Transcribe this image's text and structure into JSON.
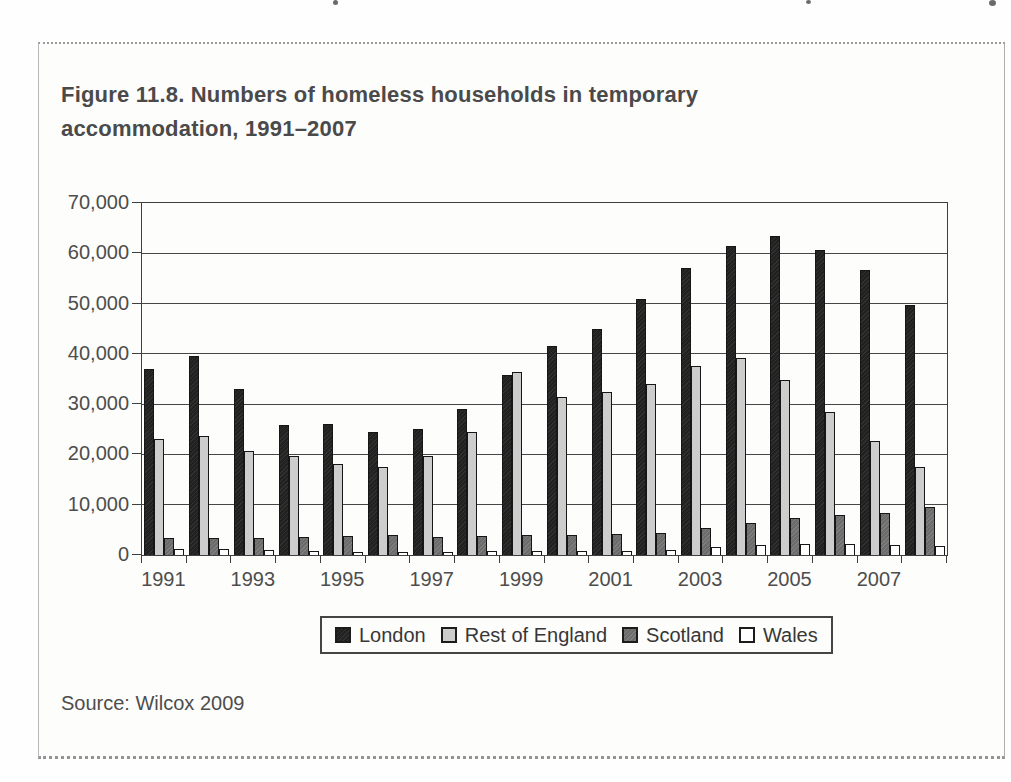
{
  "page": {
    "title_line1": "Figure 11.8. Numbers of homeless households in temporary",
    "title_line2": "accommodation, 1991–2007",
    "source": "Source: Wilcox 2009"
  },
  "chart_data": {
    "type": "bar",
    "title": "Figure 11.8. Numbers of homeless households in temporary accommodation, 1991–2007",
    "categories": [
      "1991",
      "1992",
      "1993",
      "1994",
      "1995",
      "1996",
      "1997",
      "1998",
      "1999",
      "2000",
      "2001",
      "2002",
      "2003",
      "2004",
      "2005",
      "2006",
      "2007",
      "2008"
    ],
    "x_axis_labels_shown": [
      "1991",
      "1993",
      "1995",
      "1997",
      "1999",
      "2001",
      "2003",
      "2005",
      "2007"
    ],
    "series": [
      {
        "name": "London",
        "color": "#212121",
        "values": [
          37000,
          39500,
          33000,
          25800,
          26100,
          24500,
          25000,
          29000,
          35700,
          41500,
          45000,
          51000,
          57000,
          61500,
          63500,
          60700,
          56700,
          49700
        ]
      },
      {
        "name": "Rest of England",
        "color": "#cdcdcd",
        "values": [
          23000,
          23700,
          20700,
          19700,
          18000,
          17500,
          19600,
          24500,
          36300,
          31500,
          32500,
          34000,
          37500,
          39200,
          34900,
          28500,
          22700,
          17500
        ]
      },
      {
        "name": "Scotland",
        "color": "#6c6c6c",
        "values": [
          3400,
          3400,
          3400,
          3500,
          3800,
          4000,
          3600,
          3700,
          4000,
          3900,
          4100,
          4300,
          5300,
          6400,
          7400,
          8000,
          8400,
          9500
        ]
      },
      {
        "name": "Wales",
        "color": "#ffffff",
        "values": [
          1200,
          1100,
          900,
          800,
          600,
          500,
          600,
          700,
          700,
          700,
          800,
          1000,
          1500,
          2000,
          2200,
          2100,
          2000,
          1800
        ]
      }
    ],
    "xlabel": "",
    "ylabel": "",
    "ylim": [
      0,
      70000
    ],
    "y_tick_step": 10000,
    "y_tick_labels": [
      "0",
      "10,000",
      "20,000",
      "30,000",
      "40,000",
      "50,000",
      "60,000",
      "70,000"
    ],
    "grid": true,
    "legend_position": "bottom-center",
    "source_note": "Source: Wilcox 2009"
  }
}
